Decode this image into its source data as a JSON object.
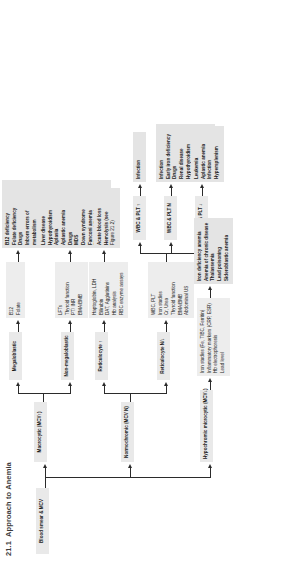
{
  "figure": {
    "number": "21.1",
    "title": "Approach to Anemia"
  },
  "root": {
    "label": "Blood smear & MCV"
  },
  "branches": {
    "hypochromic": {
      "label": "Hypochromic microcytic (MCV↓)",
      "tests": [
        "Iron studies (Fe, TIBC, Ferritin)",
        "Inflammatory markers (CRP, ESR)",
        "Hb electrophoresis",
        "Lead level"
      ],
      "diagnoses": [
        "Iron deficiency anemia",
        "Anemia of chronic disease",
        "Thalassemia",
        "Lead poisoning",
        "Sideroblastic anemia"
      ]
    },
    "normochromic": {
      "label": "Normochromic (MCV N)",
      "children": {
        "retic_low": {
          "label": "Reticulocyte N/↓",
          "tests": [
            "WBC, PLT",
            "Iron studies",
            "Cr, Urea",
            "Thyroid function",
            "BMA/BMB",
            "Abdominal US"
          ],
          "subbranches": [
            {
              "label": "WBC & PLT ↓",
              "diagnoses": [
                "Leukemia",
                "Aplastic anemia",
                "Infection",
                "Hypersplenism"
              ]
            },
            {
              "label": "WBC & PLT N",
              "diagnoses": [
                "Infection",
                "Early iron deficiency",
                "Drugs",
                "Renal disease",
                "Hypothyroidism",
                "Acute blood loss",
                "TEC",
                "Diamond-Blackfan"
              ]
            },
            {
              "label": "WBC & PLT ↑",
              "diagnoses": [
                "Infection"
              ]
            }
          ]
        },
        "retic_high": {
          "label": "Reticulocyte ↑",
          "tests": [
            "Haptoglobin, LDH",
            "Bilirubin",
            "DAT, Agglutinins",
            "Hb analysis",
            "RBC enzyme assays"
          ],
          "diagnoses": [
            "Acute blood loss",
            "Hemolysis (see",
            "Figure 21.2)"
          ]
        }
      }
    },
    "macrocytic": {
      "label": "Macrocytic (MCV↑)",
      "children": {
        "nonmegaloblastic": {
          "label": "Non-megaloblastic",
          "tests": [
            "LFTs",
            "Thyroid function",
            "PT/ INR",
            "BMA/BMB"
          ],
          "diagnoses": [
            "Liver disease",
            "Hypothyroidism",
            "Aplasia",
            "Aplastic anemia",
            "Drugs",
            "MDS",
            "Down syndrome",
            "Fanconi anemia",
            "Diamond-Blackfan",
            "Active hemolysis"
          ]
        },
        "megaloblastic": {
          "label": "Megaloblastic",
          "tests": [
            "B12",
            "Folate"
          ],
          "diagnoses": [
            "B12 deficiency",
            "Folate deficiency",
            "Drugs",
            "Inborn errors of",
            "metabolism"
          ]
        }
      }
    }
  }
}
